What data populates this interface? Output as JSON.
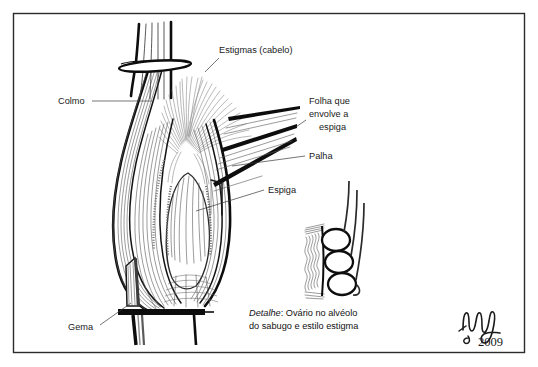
{
  "figure": {
    "language": "pt-BR",
    "background_color": "#ffffff",
    "frame_color": "#2b2b2b",
    "ink_color": "#0d0d0d",
    "silk_color": "#8a8a8a"
  },
  "labels": {
    "colmo": "Colmo",
    "estigmas": "Estigmas (cabelo)",
    "folha_envolve": "Folha que\nenvolve a\nespiga",
    "folha_envolve_line1": "Folha que",
    "folha_envolve_line2": "envolve a",
    "folha_envolve_line3": "espiga",
    "palha": "Palha",
    "espiga": "Espiga",
    "gema": "Gema"
  },
  "caption": {
    "emphasis": "Detalhe",
    "separator": ":",
    "line1": " Ovário no alvéolo",
    "line2": "do sabugo e estilo estigma",
    "full": "Detalhe: Ovário no alvéolo do sabugo e estilo estigma"
  },
  "signature": {
    "name": "Ungel",
    "year": "2009"
  },
  "detail_inset": {
    "ovary_count": 3,
    "style_count": 3,
    "description": "Ovário no alvéolo do sabugo e estilo estigma"
  }
}
